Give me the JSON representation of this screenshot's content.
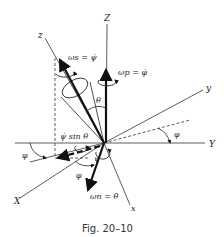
{
  "figure": {
    "caption": "Fig. 20–10",
    "axes": {
      "Z": "Z",
      "z": "z",
      "y": "y",
      "Y": "Y",
      "X": "X",
      "x": "x"
    },
    "vectors": {
      "spin": "ωs = ψ̇",
      "precession": "ωp = φ̇",
      "nutation": "ωn = θ̇",
      "spin_component": "ψ̇ sin θ"
    },
    "angles": {
      "theta": "θ",
      "phi_right": "φ",
      "phi_left": "φ",
      "phi_bottom": "φ",
      "psi": "ψ"
    },
    "colors": {
      "ink": "#222222",
      "background": "#ffffff"
    }
  }
}
